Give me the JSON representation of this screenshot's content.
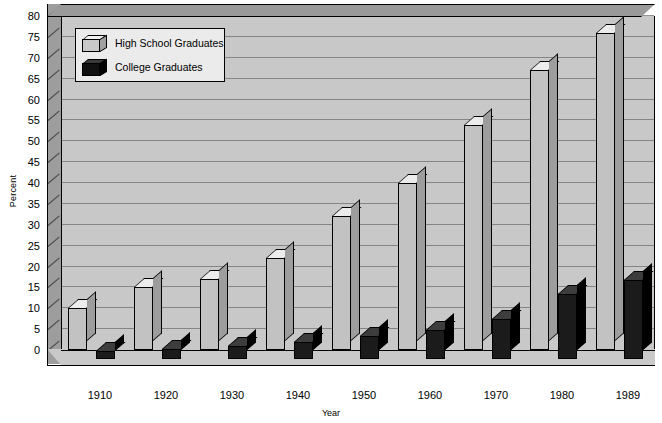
{
  "chart_data": {
    "type": "bar",
    "title": "",
    "xlabel": "Year",
    "ylabel": "Percent",
    "categories": [
      "1910",
      "1920",
      "1930",
      "1940",
      "1950",
      "1960",
      "1970",
      "1980",
      "1989"
    ],
    "series": [
      {
        "name": "High School Graduates",
        "color": "#c2c2c2",
        "values": [
          10,
          15,
          17,
          22,
          32,
          40,
          54,
          67,
          76
        ]
      },
      {
        "name": "College Graduates",
        "color": "#1b1b1b",
        "values": [
          2,
          2.5,
          3,
          4,
          5.5,
          7,
          9.5,
          15.5,
          19
        ]
      }
    ],
    "ylim": [
      0,
      80
    ],
    "ytick_step": 5,
    "yticks": [
      "0",
      "5",
      "10",
      "15",
      "20",
      "25",
      "30",
      "35",
      "40",
      "45",
      "50",
      "55",
      "60",
      "65",
      "70",
      "75",
      "80"
    ],
    "grid": true,
    "legend_position": "top-left",
    "style": "3d-bar"
  },
  "legend": {
    "items": [
      {
        "label": "High School Graduates",
        "swatch": "light-gray-cube"
      },
      {
        "label": "College Graduates",
        "swatch": "black-cube"
      }
    ]
  },
  "axes": {
    "y_title": "Percent",
    "x_title": "Year"
  }
}
